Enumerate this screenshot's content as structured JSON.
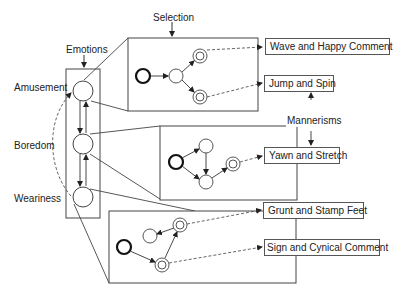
{
  "diagram": {
    "labels": {
      "selection": "Selection",
      "emotions": "Emotions",
      "mannerisms": "Mannerisms"
    },
    "emotions": [
      {
        "name": "Amusement"
      },
      {
        "name": "Boredom"
      },
      {
        "name": "Weariness"
      }
    ],
    "mannerisms": [
      {
        "label": "Wave and Happy Comment",
        "emotion": "Amusement"
      },
      {
        "label": "Jump and Spin",
        "emotion": "Amusement"
      },
      {
        "label": "Yawn and Stretch",
        "emotion": "Boredom"
      },
      {
        "label": "Grunt and Stamp Feet",
        "emotion": "Weariness"
      },
      {
        "label": "Sign and Cynical Comment",
        "emotion": "Weariness"
      }
    ],
    "colors": {
      "stroke": "#333333",
      "dashed": "#555555",
      "background": "#ffffff"
    }
  }
}
